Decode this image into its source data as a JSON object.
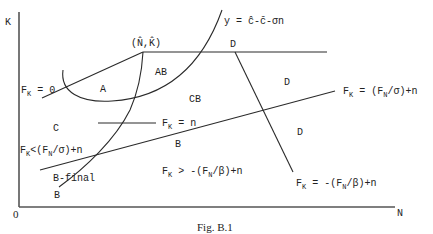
{
  "figure": {
    "caption": "Fig. B.1",
    "axes": {
      "x_label": "N",
      "y_label": "K",
      "origin_label": "0"
    },
    "point_label": {
      "text": "(N̂,K̂)"
    },
    "curve_label": {
      "text": "y = ĉ-c̄-σn"
    },
    "regions": {
      "A": "A",
      "AB": "AB",
      "CB": "CB",
      "C": "C",
      "B_mid": "B",
      "B_bottom": "B",
      "D_top": "D",
      "D_mid": "D",
      "D_right": "D",
      "B_final": "B-final"
    },
    "line_labels": {
      "fk_zero": {
        "main": "F",
        "sub": "K",
        "rest": " = 0"
      },
      "fk_n": {
        "main": "F",
        "sub": "K",
        "rest": " = n"
      },
      "fk_eq_sigma": {
        "main": "F",
        "sub": "K",
        "mid": " = (F",
        "sub2": "N",
        "rest": "/σ)+n"
      },
      "fk_lt_sigma": {
        "main": "F",
        "sub": "K",
        "mid": "<(F",
        "sub2": "N",
        "rest": "/σ)+n"
      },
      "fk_gt_beta": {
        "main": "F",
        "sub": "K",
        "mid": " > -(F",
        "sub2": "N",
        "rest": "/β)+n"
      },
      "fk_eq_beta": {
        "main": "F",
        "sub": "K",
        "mid": " = -(F",
        "sub2": "N",
        "rest": "/β)+n"
      }
    }
  }
}
